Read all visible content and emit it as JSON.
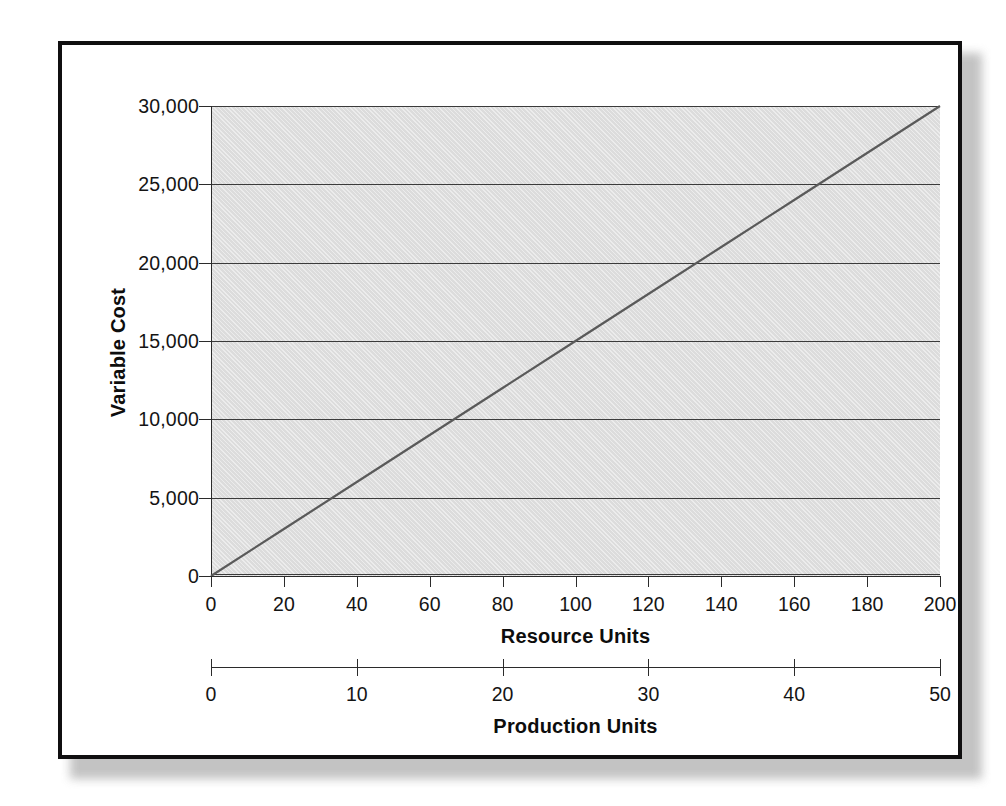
{
  "chart_data": {
    "type": "line",
    "title": "",
    "xlabel": "Resource Units",
    "ylabel": "Variable Cost",
    "secondary_xlabel": "Production Units",
    "grid": true,
    "legend": "none",
    "xlim": [
      0,
      200
    ],
    "ylim": [
      0,
      30000
    ],
    "secondary_xlim": [
      0,
      50
    ],
    "x_ticks": [
      0,
      20,
      40,
      60,
      80,
      100,
      120,
      140,
      160,
      180,
      200
    ],
    "x_tick_labels": [
      "0",
      "20",
      "40",
      "60",
      "80",
      "100",
      "120",
      "140",
      "160",
      "180",
      "200"
    ],
    "y_ticks": [
      0,
      5000,
      10000,
      15000,
      20000,
      25000,
      30000
    ],
    "y_tick_labels": [
      "0",
      "5,000",
      "10,000",
      "15,000",
      "20,000",
      "25,000",
      "30,000"
    ],
    "secondary_x_ticks": [
      0,
      10,
      20,
      30,
      40,
      50
    ],
    "secondary_x_tick_labels": [
      "0",
      "10",
      "20",
      "30",
      "40",
      "50"
    ],
    "series": [
      {
        "name": "Variable Cost",
        "x": [
          0,
          20,
          40,
          60,
          80,
          100,
          120,
          140,
          160,
          180,
          200
        ],
        "values": [
          0,
          3000,
          6000,
          9000,
          12000,
          15000,
          18000,
          21000,
          24000,
          27000,
          30000
        ],
        "color": "#5a5a5a",
        "line_width": 2.2
      }
    ],
    "slope_per_resource_unit": 150,
    "slope_per_production_unit": 600,
    "resource_units_per_production_unit": 4
  },
  "style": {
    "plot_background": "#dcdcdc",
    "grid_color": "#3b3b3b",
    "axis_color": "#2b2b2b",
    "text_color": "#141414",
    "frame_color": "#100f10",
    "page_background": "#ffffff"
  }
}
